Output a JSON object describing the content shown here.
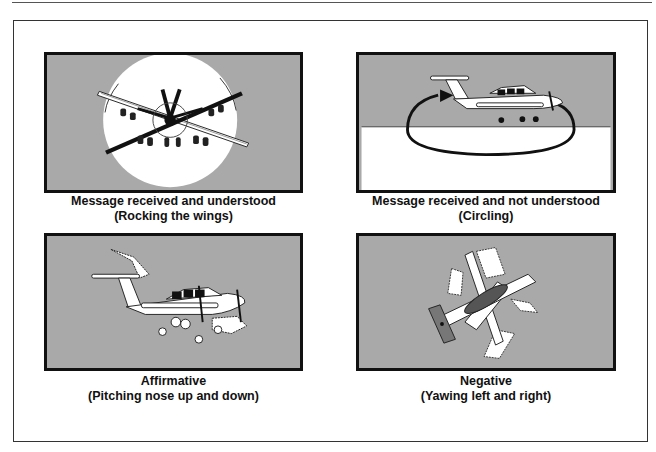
{
  "figure": {
    "panels": [
      {
        "id": "rocking-wings",
        "title": "Message received and understood",
        "subtitle": "(Rocking the wings)",
        "illustration": "airplane-rocking-wings-front-view"
      },
      {
        "id": "circling",
        "title": "Message received and not understood",
        "subtitle": "(Circling)",
        "illustration": "airplane-circling-side-view"
      },
      {
        "id": "affirmative",
        "title": "Affirmative",
        "subtitle": "(Pitching nose up and down)",
        "illustration": "airplane-pitching-side-view"
      },
      {
        "id": "negative",
        "title": "Negative",
        "subtitle": "(Yawing left and right)",
        "illustration": "airplane-yawing-top-view"
      }
    ],
    "colors": {
      "sky": "#a9a9a9",
      "ground": "#ffffff",
      "border": "#111111",
      "ink": "#111111"
    }
  }
}
